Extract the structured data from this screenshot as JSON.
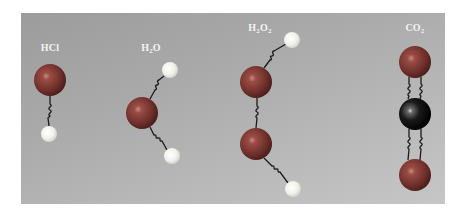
{
  "figure": {
    "background": "#ffffff",
    "panel_color": "#b0b0b0",
    "colors": {
      "oxygen": "#7a3a34",
      "chlorine": "#7a3a34",
      "hydrogen": "#f4f4f0",
      "carbon": "#111111",
      "bond": "#1a1a1a"
    },
    "molecules": [
      {
        "name": "HCl",
        "label_main": "HCl",
        "label_sub": "",
        "label_tail": "",
        "label_tail_sub": "",
        "atoms": [
          "Cl",
          "H"
        ],
        "bonds": 1
      },
      {
        "name": "H2O",
        "label_main": "H",
        "label_sub": "2",
        "label_tail": "O",
        "label_tail_sub": "",
        "atoms": [
          "H",
          "O",
          "H"
        ],
        "bonds": 2
      },
      {
        "name": "H2O2",
        "label_main": "H",
        "label_sub": "2",
        "label_tail": "O",
        "label_tail_sub": "2",
        "atoms": [
          "H",
          "O",
          "O",
          "H"
        ],
        "bonds": 3
      },
      {
        "name": "CO2",
        "label_main": "CO",
        "label_sub": "2",
        "label_tail": "",
        "label_tail_sub": "",
        "atoms": [
          "O",
          "C",
          "O"
        ],
        "bonds": 2,
        "bond_type": "double"
      }
    ]
  }
}
